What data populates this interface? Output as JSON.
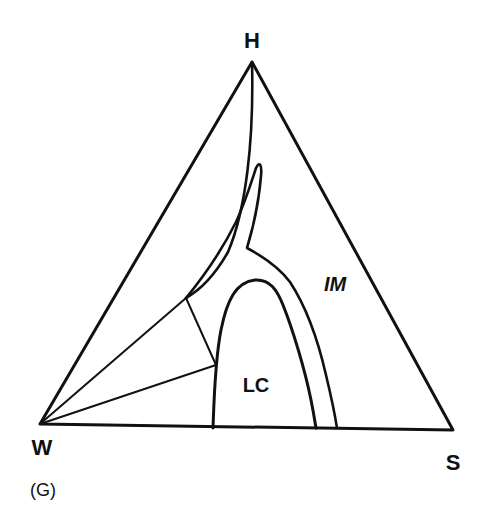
{
  "diagram": {
    "type": "ternary-phase-diagram",
    "panel_label": "(G)",
    "vertices": {
      "top": "H",
      "left": "W",
      "right": "S"
    },
    "regions": [
      {
        "id": "lc",
        "label": "LC"
      },
      {
        "id": "im",
        "label": "IM"
      }
    ],
    "colors": {
      "line": "#111111",
      "background": "#ffffff"
    }
  }
}
